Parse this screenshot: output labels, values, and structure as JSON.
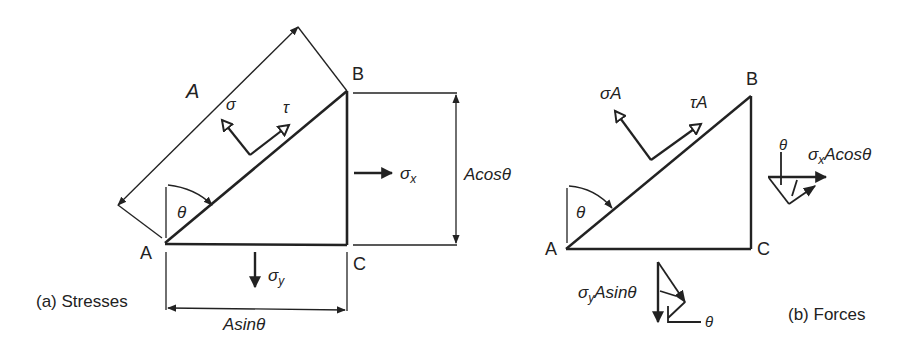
{
  "figure": {
    "panel_a": {
      "caption": "(a) Stresses",
      "vertices": {
        "A": "A",
        "B": "B",
        "C": "C"
      },
      "labels": {
        "hyp_length": "A",
        "normal_stress": "σ",
        "shear_stress": "τ",
        "sigma_x": "σ",
        "sigma_x_sub": "x",
        "sigma_y": "σ",
        "sigma_y_sub": "y",
        "theta": "θ",
        "vertical_dim": "Acosθ",
        "horizontal_dim": "Asinθ"
      }
    },
    "panel_b": {
      "caption": "(b) Forces",
      "vertices": {
        "A": "A",
        "B": "B",
        "C": "C"
      },
      "labels": {
        "normal_force": "σA",
        "shear_force": "τA",
        "theta": "θ",
        "fx_sigma": "σ",
        "fx_sub": "x",
        "fx_rest": "Acosθ",
        "fx_theta": "θ",
        "fy_sigma": "σ",
        "fy_sub": "y",
        "fy_rest": "Asinθ",
        "fy_theta": "θ"
      }
    },
    "colors": {
      "ink": "#222222",
      "background": "#ffffff"
    }
  }
}
